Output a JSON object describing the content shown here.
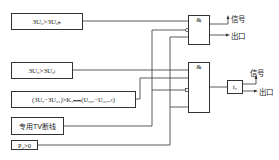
{
  "diagram": {
    "inputs": [
      {
        "id": "cond1",
        "label": "3U₀>3U₀ₕ"
      },
      {
        "id": "cond2",
        "label": "3U₀>3U₀ₗ"
      },
      {
        "id": "cond3",
        "label": "(3U₀−3U₀₁)>K₃ₘₘ(U₀₀ₑ−U₀₃ₒₑₜ)"
      },
      {
        "id": "tv_break",
        "label": "专用TV断线"
      },
      {
        "id": "p2",
        "label": "P₂>0"
      }
    ],
    "gates": [
      {
        "id": "and1",
        "label": "&"
      },
      {
        "id": "and2",
        "label": "&"
      }
    ],
    "timer": {
      "label": "t₀"
    },
    "outputs": {
      "gate1_signal": "信号",
      "gate1_trip": "出口",
      "gate2_signal": "信号",
      "gate2_trip": "出口"
    }
  }
}
